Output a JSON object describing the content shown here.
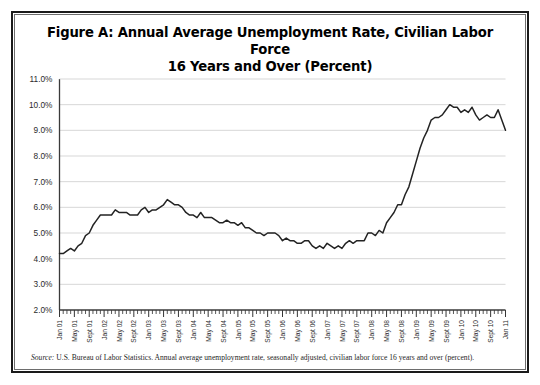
{
  "figure": {
    "title_line1": "Figure A: Annual Average Unemployment Rate, Civilian Labor Force",
    "title_line2": "16 Years and Over (Percent)",
    "source_label": "Source:",
    "source_text": "U.S. Bureau of Labor Statistics. Annual average unemployment rate, seasonally adjusted, civilian labor force 16 years and over (percent)."
  },
  "chart_data": {
    "type": "line",
    "title": "Figure A: Annual Average Unemployment Rate, Civilian Labor Force 16 Years and Over (Percent)",
    "xlabel": "",
    "ylabel": "",
    "ylim": [
      2.0,
      11.0
    ],
    "ytick_step": 1.0,
    "grid": true,
    "legend": "none",
    "line_color": "#232323",
    "ytick_labels": [
      "11.0%",
      "10.0%",
      "9.0%",
      "8.0%",
      "7.0%",
      "6.0%",
      "5.0%",
      "4.0%",
      "3.0%",
      "2.0%"
    ],
    "ytick_values": [
      11.0,
      10.0,
      9.0,
      8.0,
      7.0,
      6.0,
      5.0,
      4.0,
      3.0,
      2.0
    ],
    "xtick_labels": [
      "Jan 01",
      "May 01",
      "Sept 01",
      "Jan 02",
      "May 02",
      "Sept 02",
      "Jan 03",
      "May 03",
      "Sept 03",
      "Jan 04",
      "May 04",
      "Sept 04",
      "Jan 05",
      "May 05",
      "Sept 05",
      "Jan 06",
      "May 06",
      "Sept 06",
      "Jan 07",
      "May 07",
      "Sept 07",
      "Jan 08",
      "May 08",
      "Sept 08",
      "Jan 09",
      "May 09",
      "Sept 09",
      "Jan 10",
      "May 10",
      "Sept 10",
      "Jan 11"
    ],
    "xtick_label_indices": [
      0,
      4,
      8,
      12,
      16,
      20,
      24,
      28,
      32,
      36,
      40,
      44,
      48,
      52,
      56,
      60,
      64,
      68,
      72,
      76,
      80,
      84,
      88,
      92,
      96,
      100,
      104,
      108,
      112,
      116,
      120
    ],
    "x_count": 121,
    "x_start": "Jan 2001",
    "x_end": "Jan 2011",
    "values": [
      4.2,
      4.2,
      4.3,
      4.4,
      4.3,
      4.5,
      4.6,
      4.9,
      5.0,
      5.3,
      5.5,
      5.7,
      5.7,
      5.7,
      5.7,
      5.9,
      5.8,
      5.8,
      5.8,
      5.7,
      5.7,
      5.7,
      5.9,
      6.0,
      5.8,
      5.9,
      5.9,
      6.0,
      6.1,
      6.3,
      6.2,
      6.1,
      6.1,
      6.0,
      5.8,
      5.7,
      5.7,
      5.6,
      5.8,
      5.6,
      5.6,
      5.6,
      5.5,
      5.4,
      5.4,
      5.5,
      5.4,
      5.4,
      5.3,
      5.4,
      5.2,
      5.2,
      5.1,
      5.0,
      5.0,
      4.9,
      5.0,
      5.0,
      5.0,
      4.9,
      4.7,
      4.8,
      4.7,
      4.7,
      4.6,
      4.6,
      4.7,
      4.7,
      4.5,
      4.4,
      4.5,
      4.4,
      4.6,
      4.5,
      4.4,
      4.5,
      4.4,
      4.6,
      4.7,
      4.6,
      4.7,
      4.7,
      4.7,
      5.0,
      5.0,
      4.9,
      5.1,
      5.0,
      5.4,
      5.6,
      5.8,
      6.1,
      6.1,
      6.5,
      6.8,
      7.3,
      7.8,
      8.3,
      8.7,
      9.0,
      9.4,
      9.5,
      9.5,
      9.6,
      9.8,
      10.0,
      9.9,
      9.9,
      9.7,
      9.8,
      9.7,
      9.9,
      9.6,
      9.4,
      9.5,
      9.6,
      9.5,
      9.5,
      9.8,
      9.4,
      9.0
    ]
  }
}
